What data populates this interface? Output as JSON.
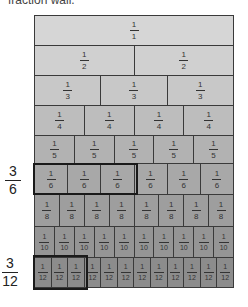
{
  "caption": "fraction wall.",
  "rows": [
    {
      "denominator": "1",
      "count": 1,
      "color": "#d6d6d6",
      "top": 0,
      "height": 30
    },
    {
      "denominator": "2",
      "count": 2,
      "color": "#d0d0d0",
      "top": 30,
      "height": 30
    },
    {
      "denominator": "3",
      "count": 3,
      "color": "#c8c8c8",
      "top": 60,
      "height": 30
    },
    {
      "denominator": "4",
      "count": 4,
      "color": "#bdbdbd",
      "top": 90,
      "height": 30
    },
    {
      "denominator": "5",
      "count": 5,
      "color": "#b2b2b2",
      "top": 120,
      "height": 28
    },
    {
      "denominator": "6",
      "count": 6,
      "color": "#a8a8a8",
      "top": 148,
      "height": 31
    },
    {
      "denominator": "8",
      "count": 8,
      "color": "#9e9e9e",
      "top": 179,
      "height": 32
    },
    {
      "denominator": "10",
      "count": 10,
      "color": "#959595",
      "top": 211,
      "height": 31
    },
    {
      "denominator": "12",
      "count": 12,
      "color": "#8c8c8c",
      "top": 242,
      "height": 31
    }
  ],
  "numerator": "1",
  "highlights": [
    {
      "label_numerator": "3",
      "label_denominator": "6",
      "box": {
        "left": 33,
        "top": 163,
        "width": 105,
        "height": 32
      },
      "label_pos": {
        "left": 5,
        "top": 164
      }
    },
    {
      "label_numerator": "3",
      "label_denominator": "12",
      "box": {
        "left": 33,
        "top": 255,
        "width": 55,
        "height": 35
      },
      "label_pos": {
        "left": 2,
        "top": 256
      }
    }
  ],
  "border_color": "#3a3a3a"
}
